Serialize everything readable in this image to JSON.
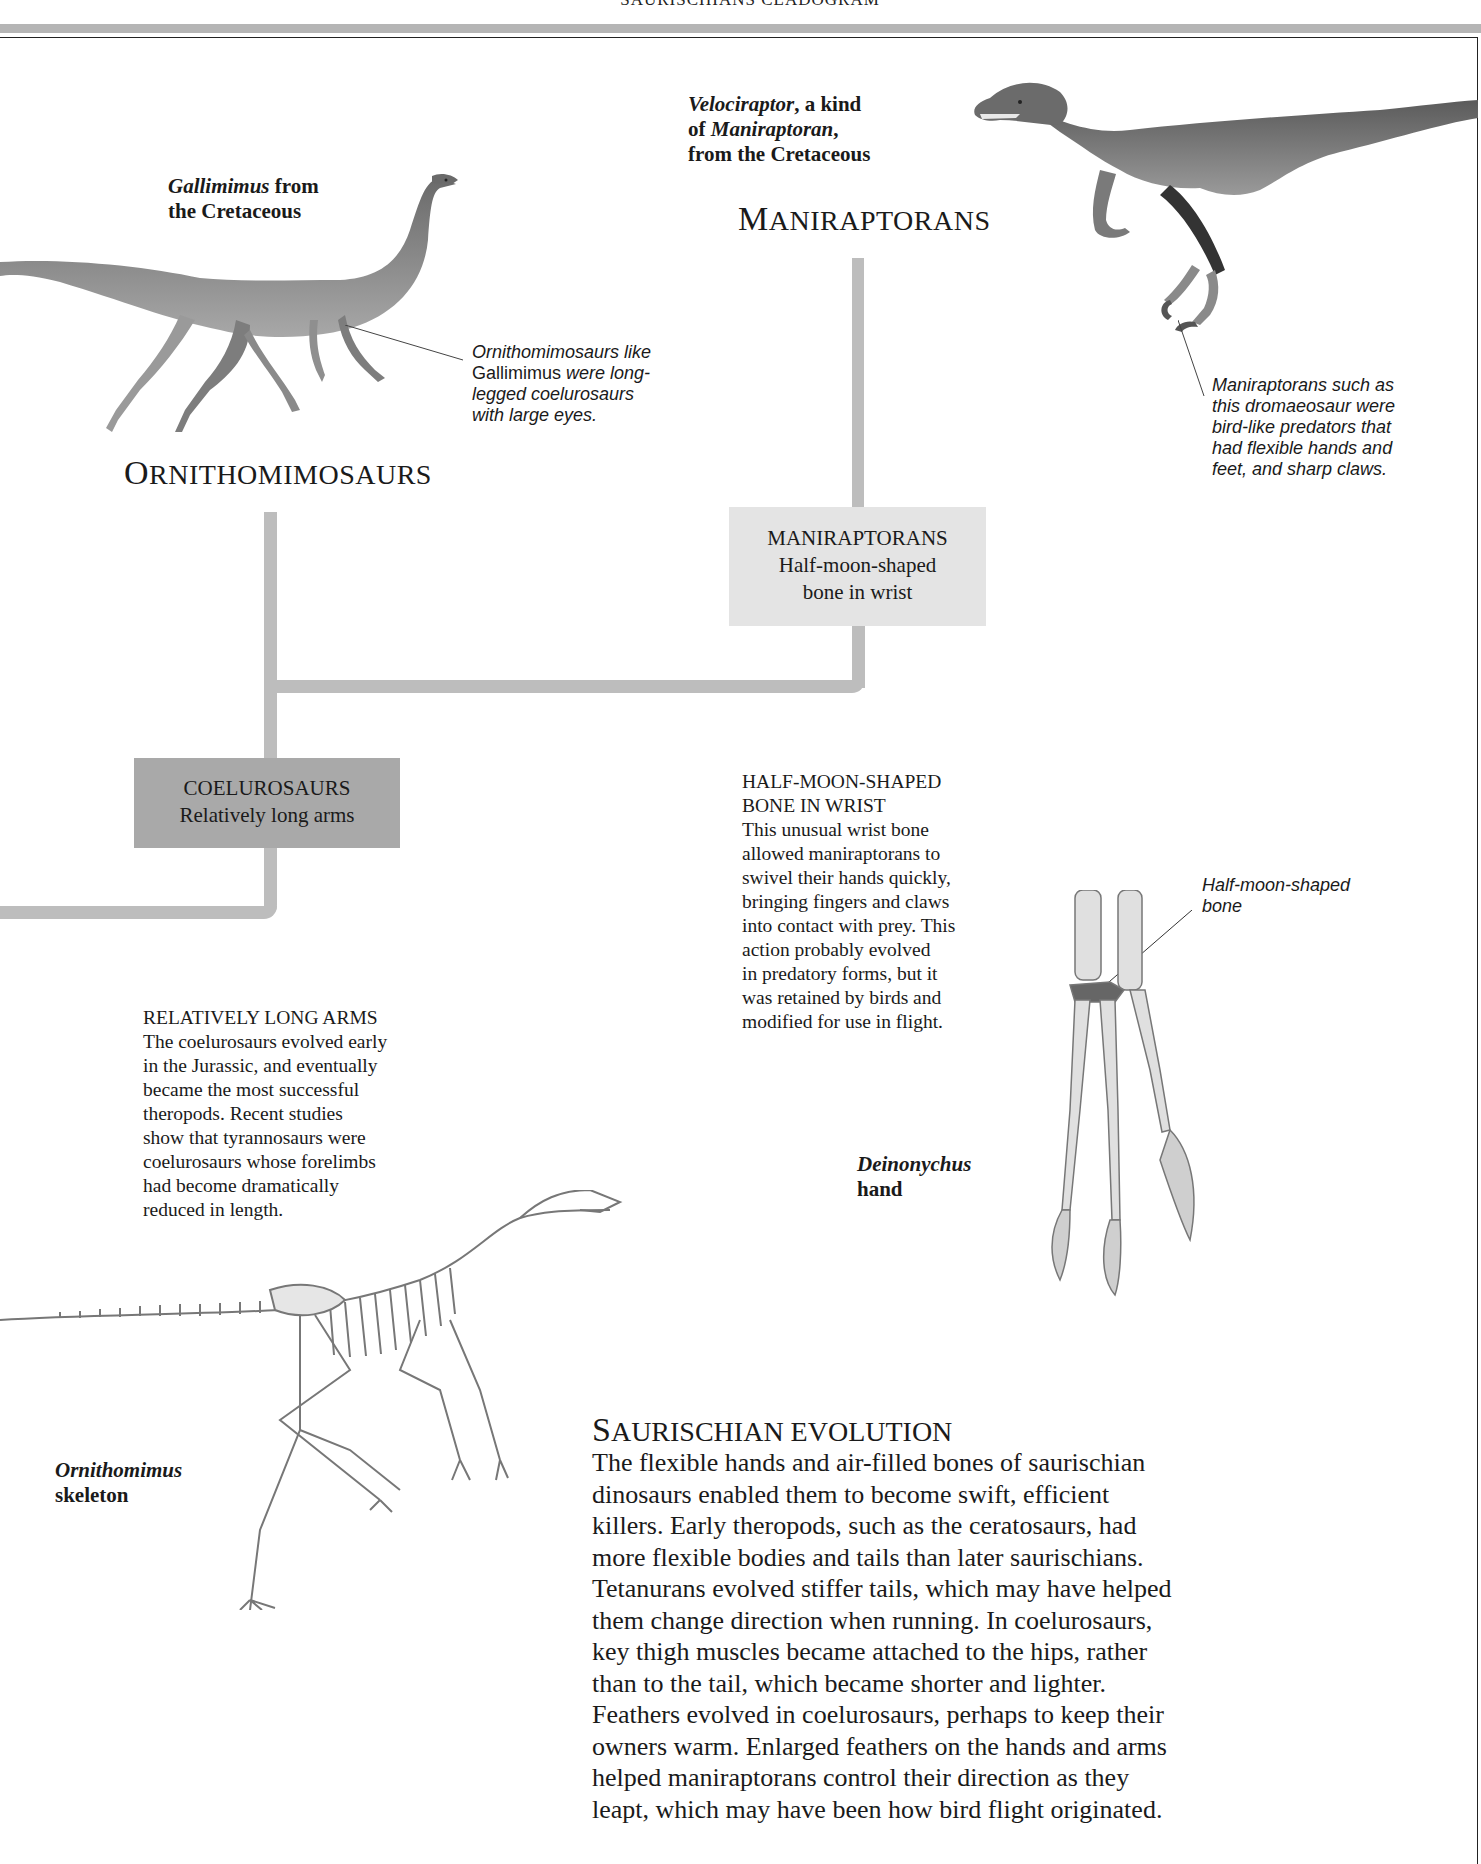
{
  "page": {
    "running_head": "SAURISCHIANS CLADOGRAM"
  },
  "captions": {
    "gallimimus": {
      "italic": "Gallimimus",
      "line1_rest": " from",
      "line2": "the Cretaceous"
    },
    "velociraptor": {
      "italic1": "Velociraptor",
      "line1_rest": ", a kind",
      "line2_pre": "of ",
      "italic2": "Maniraptoran",
      "line2_rest": ",",
      "line3": "from the Cretaceous"
    },
    "deinonychus": {
      "italic": "Deinonychus",
      "line2": "hand"
    },
    "ornithomimus": {
      "italic": "Ornithomimus",
      "line2": "skeleton"
    }
  },
  "clade_titles": {
    "ornithomimosaurs": {
      "first": "O",
      "rest": "RNITHOMIMOSAURS"
    },
    "maniraptorans": {
      "first": "M",
      "rest": "ANIRAPTORANS"
    }
  },
  "annotations": {
    "ornithomimosaurs_note": {
      "l1": "Ornithomimosaurs like",
      "l2_up": "Gallimimus",
      "l2_rest": " were long-",
      "l3": "legged coelurosaurs",
      "l4": "with large eyes."
    },
    "maniraptorans_note": {
      "l1": "Maniraptorans such as",
      "l2": "this dromaeosaur were",
      "l3": "bird-like predators that",
      "l4": "had flexible hands and",
      "l5": "feet, and sharp claws."
    },
    "half_moon_label": {
      "l1": "Half-moon-shaped",
      "l2": "bone"
    }
  },
  "cladogram": {
    "maniraptorans_box": {
      "title": "MANIRAPTORANS",
      "l1": "Half-moon-shaped",
      "l2": "bone in wrist"
    },
    "coelurosaurs_box": {
      "title": "COELUROSAURS",
      "l1": "Relatively long arms"
    },
    "branch_color": "#bdbdbd",
    "box_light_color": "#e4e4e4",
    "box_dark_color": "#a9a9a9"
  },
  "sections": {
    "half_moon": {
      "head1": "HALF-MOON-SHAPED",
      "head2": "BONE IN WRIST",
      "lines": [
        "This unusual wrist bone",
        "allowed maniraptorans to",
        "swivel their hands quickly,",
        "bringing fingers and claws",
        "into contact with prey. This",
        "action probably evolved",
        "in predatory forms, but it",
        "was retained by birds and",
        "modified for use in flight."
      ]
    },
    "long_arms": {
      "head": "RELATIVELY LONG ARMS",
      "lines": [
        "The coelurosaurs evolved early",
        "in the Jurassic, and eventually",
        "became the most successful",
        "theropods. Recent studies",
        "show that tyrannosaurs were",
        "coelurosaurs whose forelimbs",
        "had become dramatically",
        "reduced in length."
      ]
    },
    "evolution": {
      "title_first": "S",
      "title_rest": "AURISCHIAN EVOLUTION",
      "lines": [
        "The flexible hands and air-filled bones of saurischian",
        "dinosaurs enabled them to become swift, efficient",
        "killers. Early theropods, such as the ceratosaurs, had",
        "more flexible bodies and tails than later saurischians.",
        "Tetanurans evolved stiffer tails, which may have helped",
        "them change direction when running. In coelurosaurs,",
        "key thigh muscles became attached to the hips, rather",
        "than to the tail, which became shorter and lighter.",
        "Feathers evolved in coelurosaurs, perhaps to keep their",
        "owners warm. Enlarged feathers on the hands and arms",
        "helped maniraptorans control their direction as they",
        "leapt, which may have been how bird flight originated."
      ]
    }
  }
}
